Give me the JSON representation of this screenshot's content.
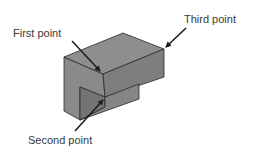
{
  "diagram": {
    "type": "isometric-block-selection",
    "labels": {
      "first_point": "First point",
      "second_point": "Second point",
      "third_point": "Third point"
    },
    "colors": {
      "top_face": "#8c8c8c",
      "front_face": "#7c7c7c",
      "side_face": "#929292",
      "notch_face": "#6e6e6e",
      "edge": "#2a2a2a",
      "arrow": "#1e1e1e",
      "text": "#3a3a3a"
    }
  }
}
